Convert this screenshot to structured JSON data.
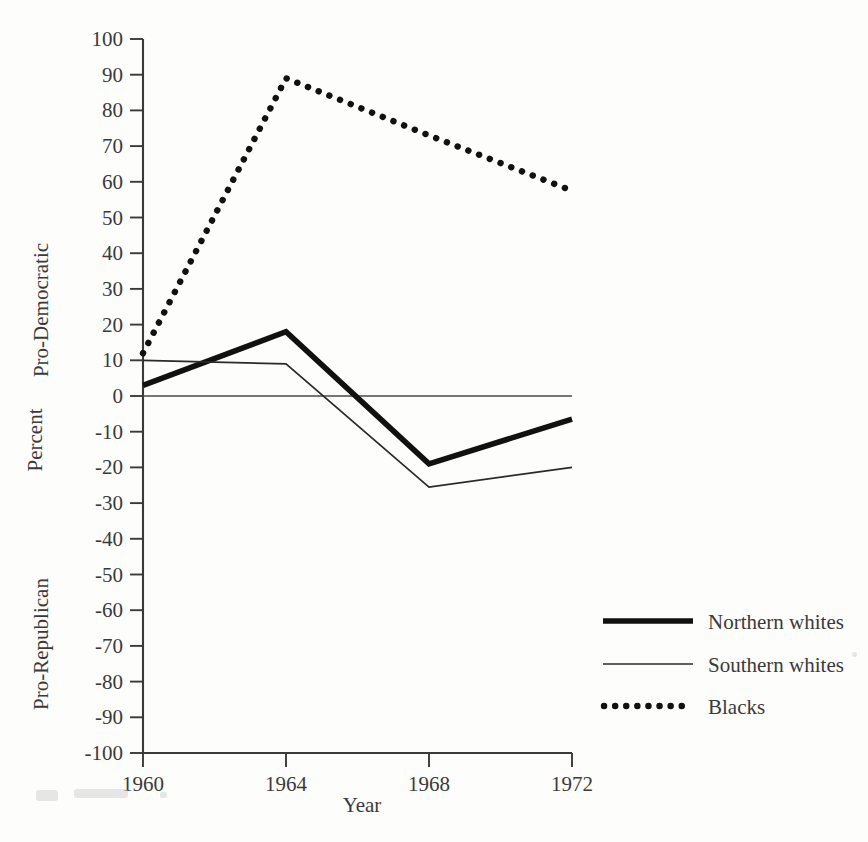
{
  "chart_data": {
    "type": "line",
    "title": "",
    "xlabel": "Year",
    "ylabel": "Percent",
    "ylabel_upper": "Pro-Democratic",
    "ylabel_lower": "Pro-Republican",
    "x": [
      1960,
      1964,
      1968,
      1972
    ],
    "categories": [
      "1960",
      "1964",
      "1968",
      "1972"
    ],
    "xlim": [
      1960,
      1972
    ],
    "ylim": [
      -100,
      100
    ],
    "yticks": [
      100,
      90,
      80,
      70,
      60,
      50,
      40,
      30,
      20,
      10,
      0,
      -10,
      -20,
      -30,
      -40,
      -50,
      -60,
      -70,
      -80,
      -90,
      -100
    ],
    "ytick_labels": [
      "100",
      "90",
      "80",
      "70",
      "60",
      "50",
      "40",
      "30",
      "20",
      "10",
      "0",
      "-10",
      "-20",
      "-30",
      "-40",
      "-50",
      "-60",
      "-70",
      "-80",
      "-90",
      "-100"
    ],
    "xtick_labels": [
      "1960",
      "1964",
      "1968",
      "1972"
    ],
    "grid": false,
    "zero_reference_line": true,
    "legend_position": "right-lower",
    "series": [
      {
        "name": "Northern whites",
        "style": "thick-solid",
        "color": "#111111",
        "values": [
          3,
          18,
          -19,
          -6.5
        ]
      },
      {
        "name": "Southern whites",
        "style": "thin-solid",
        "color": "#2a2a2a",
        "values": [
          10,
          9,
          -25.5,
          -20
        ]
      },
      {
        "name": "Blacks",
        "style": "dotted",
        "color": "#111111",
        "values": [
          12,
          89,
          73,
          57.5
        ]
      }
    ]
  },
  "legend": {
    "items": [
      {
        "label": "Northern whites",
        "swatch": "thick-line-swatch"
      },
      {
        "label": "Southern whites",
        "swatch": "thin-line-swatch"
      },
      {
        "label": "Blacks",
        "swatch": "dotted-line-swatch"
      }
    ]
  }
}
